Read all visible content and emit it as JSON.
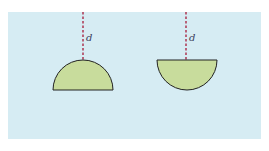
{
  "figure": {
    "background_color": "#d6ecf3",
    "shape_fill": "#c8dc9c",
    "outline_color": "#222222",
    "dash_color": "#b0405a",
    "shapes": [
      {
        "name": "hemisphere-curved-side-up",
        "depth_label": "d"
      },
      {
        "name": "hemisphere-flat-side-up",
        "depth_label": "d"
      }
    ]
  }
}
